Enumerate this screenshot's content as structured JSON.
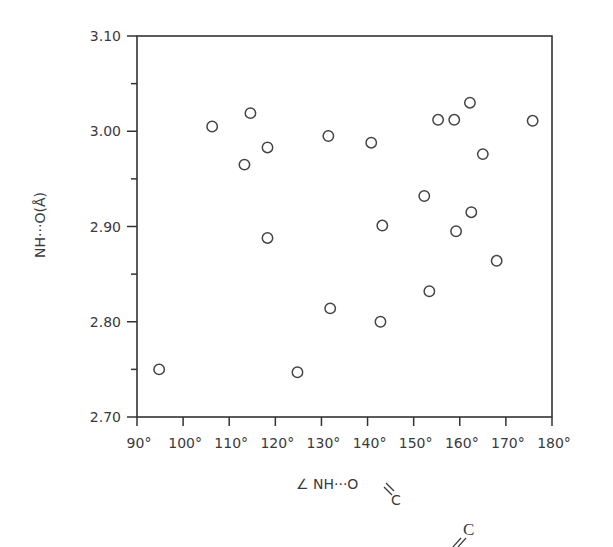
{
  "chart_data": {
    "type": "scatter",
    "title": "",
    "xlabel": "∠NH···O=C",
    "xlabel_parts": {
      "angle": "∠",
      "main": "NH···O",
      "bond": "=",
      "sub": "C"
    },
    "ylabel": "NH···O(Å)",
    "xlim": [
      90,
      180
    ],
    "ylim": [
      2.7,
      3.1
    ],
    "xticks": [
      90,
      100,
      110,
      120,
      130,
      140,
      150,
      160,
      170,
      180
    ],
    "xtick_labels": [
      "90°",
      "100°",
      "110°",
      "120°",
      "130°",
      "140°",
      "150°",
      "160°",
      "170°",
      "180°"
    ],
    "yticks_major": [
      2.7,
      2.8,
      2.9,
      3.0,
      3.1
    ],
    "ytick_labels": [
      "2.70",
      "2.80",
      "2.90",
      "3.00",
      "3.10"
    ],
    "yticks_minor": [
      2.75,
      2.85,
      2.95,
      3.05
    ],
    "grid": false,
    "legend": null,
    "marker": "open-circle",
    "points": [
      {
        "x": 94.8,
        "y": 2.75
      },
      {
        "x": 106.3,
        "y": 3.005
      },
      {
        "x": 113.3,
        "y": 2.965
      },
      {
        "x": 114.6,
        "y": 3.019
      },
      {
        "x": 118.3,
        "y": 2.983
      },
      {
        "x": 118.3,
        "y": 2.888
      },
      {
        "x": 124.8,
        "y": 2.747
      },
      {
        "x": 131.5,
        "y": 2.995
      },
      {
        "x": 131.9,
        "y": 2.814
      },
      {
        "x": 140.8,
        "y": 2.988
      },
      {
        "x": 142.8,
        "y": 2.8
      },
      {
        "x": 143.2,
        "y": 2.901
      },
      {
        "x": 152.3,
        "y": 2.932
      },
      {
        "x": 153.4,
        "y": 2.832
      },
      {
        "x": 155.3,
        "y": 3.012
      },
      {
        "x": 158.8,
        "y": 3.012
      },
      {
        "x": 159.2,
        "y": 2.895
      },
      {
        "x": 162.2,
        "y": 3.03
      },
      {
        "x": 162.5,
        "y": 2.915
      },
      {
        "x": 165.0,
        "y": 2.976
      },
      {
        "x": 168.0,
        "y": 2.864
      },
      {
        "x": 175.8,
        "y": 3.011
      }
    ]
  },
  "footer_fragment": {
    "letter": "C",
    "bond": "//"
  },
  "colors": {
    "ink": "#333333",
    "background": "#ffffff"
  }
}
